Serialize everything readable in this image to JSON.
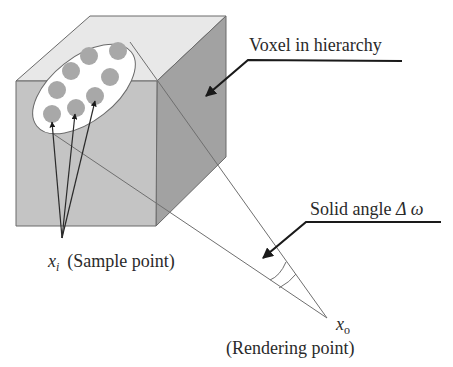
{
  "diagram": {
    "labels": {
      "voxel": "Voxel in hierarchy",
      "solid_angle_prefix": "Solid angle ",
      "solid_angle_symbol": "Δ ω",
      "sample_var": "x",
      "sample_sub": "i",
      "sample_desc": "(Sample point)",
      "render_var": "x",
      "render_sub": "o",
      "render_desc": "(Rendering point)"
    },
    "colors": {
      "front_face": "#c4c4c4",
      "top_face": "#e8e8e8",
      "right_face": "#a2a2a2",
      "edge": "#6a6a6a",
      "ellipse_fill": "#ffffff",
      "sample_dot": "#a8a8a8",
      "arrow": "#1a1a1a",
      "ray": "#6f6f6f"
    },
    "sample_point_count": 8
  }
}
